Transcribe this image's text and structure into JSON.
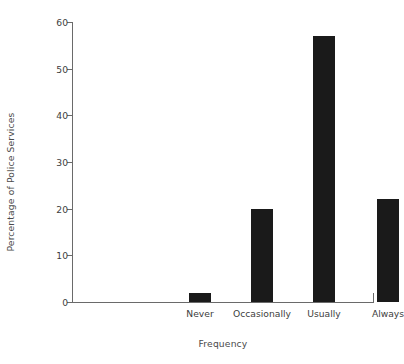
{
  "chart_data": {
    "type": "bar",
    "title": "",
    "categories": [
      "Never",
      "Occasionally",
      "Usually",
      "Always"
    ],
    "values": [
      2,
      20,
      57,
      22
    ],
    "series": [
      {
        "name": "Percentage of Police Services",
        "values": [
          2,
          20,
          57,
          22
        ]
      }
    ],
    "xlabel": "Frequency",
    "ylabel": "Percentage of Police Services",
    "ylim": [
      0,
      60
    ],
    "yticks": [
      0,
      10,
      20,
      30,
      40,
      50,
      60
    ],
    "ytick_labels": [
      "0",
      "10",
      "20",
      "30",
      "40",
      "50",
      "60"
    ],
    "xtick_labels": [
      "Never",
      "Occasionally",
      "Usually",
      "Always"
    ],
    "grid": false,
    "legend": null,
    "bar_color": "#1a1a1a",
    "axis_color": "#6a6a6a",
    "background_color": "#ffffff"
  }
}
